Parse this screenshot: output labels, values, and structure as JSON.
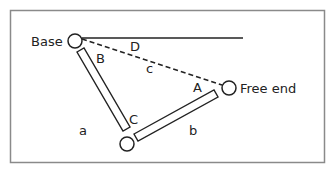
{
  "diagram": {
    "labels": {
      "base": "Base",
      "free_end": "Free end",
      "link_a": "a",
      "link_b": "b",
      "line_c": "c",
      "angle_A": "A",
      "angle_B": "B",
      "angle_C": "C",
      "angle_D": "D"
    },
    "colors": {
      "stroke": "#222222",
      "frame": "#888888",
      "background": "#ffffff"
    }
  }
}
